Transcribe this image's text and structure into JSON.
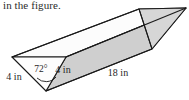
{
  "figure": {
    "caption": "in the figure.",
    "shape_name": "triangular-prism",
    "colors": {
      "stroke": "#1a1a1a",
      "shaded_face_fill": "#cfcfcf",
      "light_face_fill": "#fcfcfc",
      "background": "#ffffff",
      "text": "#1f1f1f"
    },
    "labels": [
      {
        "id": "left-side-length",
        "text": "4 in",
        "x": 14,
        "y": 80,
        "anchor": "middle"
      },
      {
        "id": "base-angle",
        "text": "72°",
        "x": 41,
        "y": 72,
        "anchor": "middle"
      },
      {
        "id": "right-side-length",
        "text": "4 in",
        "x": 63,
        "y": 73,
        "anchor": "middle"
      },
      {
        "id": "prism-length",
        "text": "18 in",
        "x": 118,
        "y": 76,
        "anchor": "middle"
      }
    ],
    "dimensions": {
      "triangle_side_a": "4 in",
      "triangle_side_b": "4 in",
      "apex_angle": "72°",
      "prism_length": "18 in"
    },
    "geometry": {
      "front_bottom_vertex": "46,91",
      "front_left_vertex": "12,57",
      "front_top_vertex": "66,57",
      "back_bottom_vertex": "152,49",
      "back_left_vertex": "139,9",
      "back_top_vertex": "186,8",
      "shaded_face_points": "46,91 66,57 186,8 152,49",
      "top_face_points": "12,57 66,57 186,8 139,9",
      "left_triangle_points": "12,57 66,57 46,91",
      "right_triangle_points": "139,9 186,8 152,49",
      "hidden_edge": "139,9 152,49"
    }
  }
}
